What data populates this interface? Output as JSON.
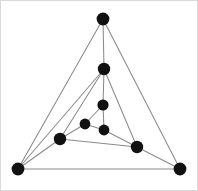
{
  "figure": {
    "title": "Undirected graph diagram",
    "description": "Nested triangular graph with 8 vertices and 15 edges",
    "width": 198,
    "height": 191,
    "background_color": "#ffffff",
    "border_color": "#d9d9d9",
    "node_color": "#111111",
    "edge_color": "#8a8a8a",
    "node_radius": 6.2,
    "inner_node_radius": 5.4,
    "edge_width": 1.05
  },
  "chart_data": {
    "type": "diagram",
    "title": "Undirected graph diagram",
    "xlabel": "",
    "ylabel": "",
    "node_count": 8,
    "edge_count": 15,
    "nodes": [
      {
        "id": "n1",
        "label": "apex",
        "x": 103,
        "y": 19,
        "r": 6.4
      },
      {
        "id": "n2",
        "label": "upper-mid",
        "x": 104,
        "y": 69,
        "r": 6.2
      },
      {
        "id": "n3",
        "label": "inner-top",
        "x": 103,
        "y": 105,
        "r": 5.6
      },
      {
        "id": "n4",
        "label": "inner-left",
        "x": 85,
        "y": 124,
        "r": 5.4
      },
      {
        "id": "n5",
        "label": "inner-bottom",
        "x": 104,
        "y": 130,
        "r": 5.4
      },
      {
        "id": "n6",
        "label": "left-mid",
        "x": 60,
        "y": 139,
        "r": 6.2
      },
      {
        "id": "n7",
        "label": "right-mid",
        "x": 137,
        "y": 147,
        "r": 6.2
      },
      {
        "id": "n8",
        "label": "bottom-left",
        "x": 18,
        "y": 169,
        "r": 6.4
      },
      {
        "id": "n9",
        "label": "bottom-right",
        "x": 180,
        "y": 169,
        "r": 6.4
      }
    ],
    "edges": [
      {
        "from": "n1",
        "to": "n2"
      },
      {
        "from": "n1",
        "to": "n8"
      },
      {
        "from": "n1",
        "to": "n9"
      },
      {
        "from": "n2",
        "to": "n3"
      },
      {
        "from": "n2",
        "to": "n6"
      },
      {
        "from": "n2",
        "to": "n7"
      },
      {
        "from": "n2",
        "to": "n8"
      },
      {
        "from": "n3",
        "to": "n4"
      },
      {
        "from": "n3",
        "to": "n5"
      },
      {
        "from": "n4",
        "to": "n5"
      },
      {
        "from": "n4",
        "to": "n6"
      },
      {
        "from": "n5",
        "to": "n7"
      },
      {
        "from": "n6",
        "to": "n7"
      },
      {
        "from": "n6",
        "to": "n8"
      },
      {
        "from": "n8",
        "to": "n9"
      },
      {
        "from": "n7",
        "to": "n9"
      }
    ]
  }
}
